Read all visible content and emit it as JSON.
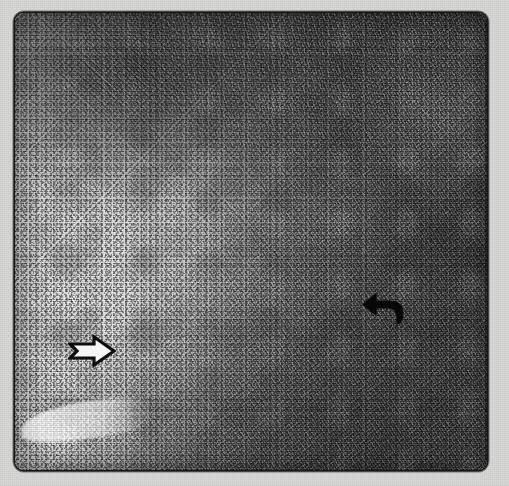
{
  "figure": {
    "kind": "histopathology-micrograph",
    "modality": "light microscopy, H&E-type grayscale print reproduction",
    "canvas": {
      "width": 509,
      "height": 486
    },
    "page_background": "#d6d6d4",
    "frame": {
      "x": 15,
      "y": 13,
      "width": 472,
      "height": 457,
      "corner_radius_px": 9,
      "border_color": "#1b1b1b",
      "border_width_px": 2
    }
  },
  "regions": [
    {
      "id": "pale-cellular-field",
      "label": "Pale finely speckled cellular field",
      "position": "left and lower-left",
      "tone": "light gray",
      "tone_hex": "#dedede",
      "texture": "uniform fine dark nuclear dots on a pale background"
    },
    {
      "id": "dark-fibrillar-field",
      "label": "Dark coarsely fibrillar field",
      "position": "right and upper-right",
      "tone": "dark gray",
      "tone_hex": "#6a6a6a",
      "texture": "interlacing coarse streaks and dense chromatin clumps"
    },
    {
      "id": "nodular-cluster",
      "label": "Dark nodular cluster",
      "position": "upper left of centre",
      "tone_hex": "#4a4a4a"
    },
    {
      "id": "interface",
      "label": "Irregular diagonal interface between the two fields",
      "orientation": "runs from upper-left toward lower-right"
    },
    {
      "id": "pale-cleft",
      "label": "Pale linear cleft / vessel-like space",
      "position": "bottom-left corner",
      "tone_hex": "#f2f2f2"
    }
  ],
  "annotations": [
    {
      "id": "arrow-open-right",
      "glyph": "open-outline-arrow-right",
      "style": "hollow white arrow with black outline",
      "direction": "right",
      "outline_color": "#111111",
      "fill_color": "#f2f2f2",
      "x": 68,
      "y": 334,
      "width": 48,
      "height": 34,
      "points_at": "pale-cellular-field"
    },
    {
      "id": "arrow-curved-left",
      "glyph": "curved-solid-arrow-left",
      "style": "solid black hooked arrow",
      "direction": "left",
      "fill_color": "#0d0d0d",
      "x": 362,
      "y": 292,
      "width": 44,
      "height": 34,
      "points_at": "dark-fibrillar-field"
    }
  ],
  "scale_bar": null,
  "caption": null,
  "labels": []
}
